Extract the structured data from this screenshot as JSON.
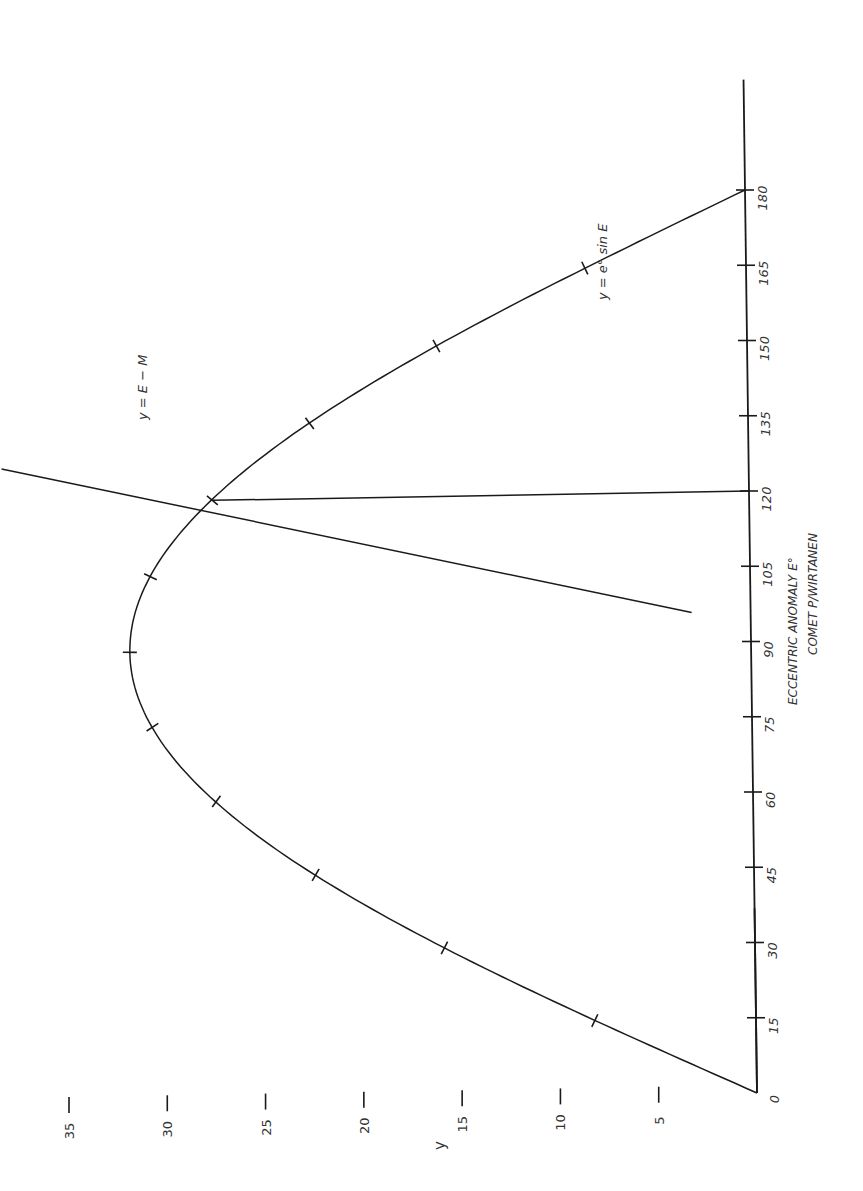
{
  "chart_data": {
    "type": "line",
    "orientation": "rotated 90° counter-clockwise (E axis runs bottom-to-top on the right, y axis runs right-to-left at the bottom)",
    "title": "",
    "xlabel": "ECCENTRIC ANOMALY E°",
    "subtitle": "COMET P/WIRTANEN",
    "ylabel": "y",
    "x_ticks": [
      "0",
      "15",
      "30",
      "45",
      "60",
      "75",
      "90",
      "105",
      "120",
      "135",
      "150",
      "165",
      "180"
    ],
    "y_ticks": [
      "0",
      "5",
      "10",
      "15",
      "20",
      "25",
      "30",
      "35"
    ],
    "xlim": [
      0,
      180
    ],
    "ylim": [
      0,
      35
    ],
    "grid": false,
    "series": [
      {
        "name": "y = e° sin E",
        "x": [
          0,
          15,
          30,
          45,
          60,
          75,
          90,
          105,
          120,
          135,
          150,
          165,
          180
        ],
        "values": [
          0,
          8.2,
          15.8,
          22.3,
          27.3,
          30.5,
          31.6,
          30.5,
          27.3,
          22.3,
          15.8,
          8.2,
          0
        ]
      },
      {
        "name": "y = E - M",
        "x": [
          96,
          127
        ],
        "values": [
          3,
          38
        ]
      }
    ],
    "annotations": [
      {
        "text": "y = e° sin E",
        "near_E": 160
      },
      {
        "text": "y = E − M",
        "near_E": 130
      },
      {
        "text": "intersection",
        "E": 120,
        "y": 27.3,
        "note": "vertical drop line from intersection to E = 120 on the E axis"
      }
    ]
  },
  "labels": {
    "curve_label": "y = e° sin E",
    "line_label": "y = E − M",
    "x_axis_title": "ECCENTRIC ANOMALY E°",
    "x_axis_subtitle": "COMET P/WIRTANEN",
    "y_axis_title": "y"
  }
}
